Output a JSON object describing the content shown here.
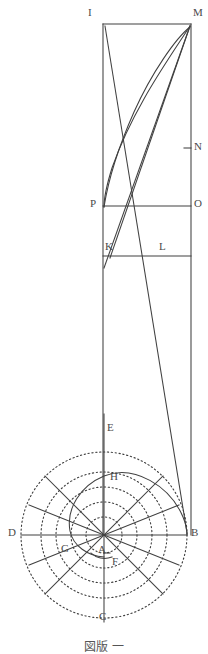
{
  "figure": {
    "stroke_color": "#404040",
    "dotted_color": "#3d3d3d",
    "background": "#ffffff",
    "width": 208,
    "height": 646
  },
  "labels": {
    "I": "I",
    "M": "M",
    "N": "N",
    "P": "P",
    "O": "O",
    "K": "K",
    "L": "L",
    "E": "E",
    "H": "H",
    "D": "D",
    "B": "B",
    "G": "G",
    "A": "A",
    "F": "F",
    "C": "C"
  },
  "points": [
    {
      "id": "I",
      "label": "I",
      "x": 103,
      "y": 24,
      "label_x": 90,
      "label_y": 9
    },
    {
      "id": "M",
      "label": "M",
      "x": 191,
      "y": 24,
      "label_x": 193,
      "label_y": 9
    },
    {
      "id": "N",
      "label": "N",
      "x": 191,
      "y": 148,
      "label_x": 193,
      "label_y": 141
    },
    {
      "id": "P",
      "label": "P",
      "x": 103,
      "y": 206,
      "label_x": 90,
      "label_y": 199
    },
    {
      "id": "O",
      "label": "O",
      "x": 191,
      "y": 206,
      "label_x": 193,
      "label_y": 199
    },
    {
      "id": "K",
      "label": "K",
      "x": 110,
      "y": 255,
      "label_x": 104,
      "label_y": 240
    },
    {
      "id": "L",
      "label": "L",
      "x": 165,
      "y": 255,
      "label_x": 160,
      "label_y": 240
    },
    {
      "id": "E",
      "label": "E",
      "x": 104,
      "y": 432,
      "label_x": 107,
      "label_y": 423
    },
    {
      "id": "H",
      "label": "H",
      "x": 113,
      "y": 480,
      "label_x": 110,
      "label_y": 473
    },
    {
      "id": "D",
      "label": "D",
      "x": 24,
      "y": 535,
      "label_x": 10,
      "label_y": 528
    },
    {
      "id": "B",
      "label": "B",
      "x": 187,
      "y": 535,
      "label_x": 190,
      "label_y": 528
    },
    {
      "id": "G",
      "label": "G",
      "x": 72,
      "y": 551,
      "label_x": 62,
      "label_y": 543
    },
    {
      "id": "A",
      "label": "A",
      "x": 104,
      "y": 535,
      "label_x": 100,
      "label_y": 545
    },
    {
      "id": "F",
      "label": "F",
      "x": 110,
      "y": 560,
      "label_x": 111,
      "label_y": 554
    },
    {
      "id": "C",
      "label": "C",
      "x": 104,
      "y": 620,
      "label_x": 100,
      "label_y": 612
    }
  ],
  "caption": {
    "text": "図版 一",
    "visible": "partial"
  },
  "geometry": {
    "rect_left_x": 103,
    "rect_right_x": 191,
    "rect_top_y": 24,
    "line_PO_y": 206,
    "line_KL_y": 255,
    "circle_center_x": 104,
    "circle_center_y": 535,
    "circle_radii": [
      18,
      32,
      47,
      62,
      83
    ],
    "dotted_circle_count": 4,
    "spoke_count": 8
  }
}
